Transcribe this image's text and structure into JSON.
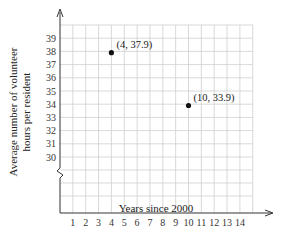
{
  "chart_data": {
    "type": "scatter",
    "title": "",
    "xlabel": "Years since 2000",
    "ylabel": "Average number of volunteer hours per resident",
    "ylabel_lines": [
      "Average number of volunteer",
      "hours per resident"
    ],
    "x_ticks": [
      1,
      2,
      3,
      4,
      5,
      6,
      7,
      8,
      9,
      10,
      11,
      12,
      13,
      14
    ],
    "y_ticks": [
      30,
      31,
      32,
      33,
      34,
      35,
      36,
      37,
      38,
      39
    ],
    "xlim": [
      0,
      15
    ],
    "ylim": [
      30,
      40
    ],
    "y_axis_break": true,
    "grid": true,
    "points": [
      {
        "x": 4,
        "y": 37.9,
        "label": "(4, 37.9)"
      },
      {
        "x": 10,
        "y": 33.9,
        "label": "(10, 33.9)"
      }
    ],
    "colors": {
      "grid": "#cfcfcf",
      "axis": "#333333",
      "point": "#111111"
    }
  }
}
